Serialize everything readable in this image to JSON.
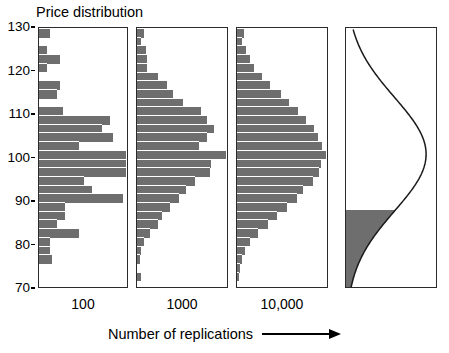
{
  "figure": {
    "title": "Price distribution",
    "x_axis_caption": "Number of replications",
    "var_label": "VAR"
  },
  "chart_data": {
    "type": "bar",
    "title": "Price distribution",
    "xlabel": "Number of replications",
    "ylabel": "Price distribution",
    "ylim": [
      70,
      130
    ],
    "yticks": [
      130,
      120,
      110,
      100,
      90,
      80,
      70
    ],
    "ytick_labels": [
      "130",
      "120",
      "110",
      "100",
      "90",
      "80",
      "70"
    ],
    "grid": false,
    "legend": null,
    "orientation": "horizontal",
    "panels": [
      {
        "name": "panel-100-replications",
        "xtick_label": "100",
        "replications": 100,
        "bin_low": 70,
        "bin_high": 130,
        "bin_width": 2,
        "categories": [
          128,
          126,
          124,
          122,
          120,
          118,
          116,
          114,
          112,
          110,
          108,
          106,
          104,
          102,
          100,
          98,
          96,
          94,
          92,
          90,
          88,
          86,
          84,
          82,
          80,
          78,
          76,
          74,
          72,
          70
        ],
        "values": [
          4,
          0,
          3,
          8,
          3,
          0,
          8,
          7,
          0,
          9,
          27,
          24,
          28,
          15,
          33,
          33,
          33,
          17,
          20,
          32,
          10,
          10,
          7,
          15,
          4,
          4,
          5,
          0,
          0,
          0
        ]
      },
      {
        "name": "panel-1000-replications",
        "xtick_label": "1000",
        "replications": 1000,
        "bin_low": 70,
        "bin_high": 130,
        "bin_width": 2,
        "categories": [
          128,
          126,
          124,
          122,
          120,
          118,
          116,
          114,
          112,
          110,
          108,
          106,
          104,
          102,
          100,
          98,
          96,
          94,
          92,
          90,
          88,
          86,
          84,
          82,
          80,
          78,
          76,
          74,
          72,
          70
        ],
        "values": [
          5,
          3,
          6,
          7,
          7,
          14,
          20,
          24,
          31,
          43,
          47,
          52,
          47,
          42,
          60,
          50,
          49,
          39,
          33,
          28,
          22,
          17,
          14,
          9,
          5,
          3,
          2,
          0,
          3,
          0
        ]
      },
      {
        "name": "panel-10000-replications",
        "xtick_label": "10,000",
        "replications": 10000,
        "bin_low": 70,
        "bin_high": 130,
        "bin_width": 2,
        "categories": [
          128,
          126,
          124,
          122,
          120,
          118,
          116,
          114,
          112,
          110,
          108,
          106,
          104,
          102,
          100,
          98,
          96,
          94,
          92,
          90,
          88,
          86,
          84,
          82,
          80,
          78,
          76,
          74,
          72,
          70
        ],
        "values": [
          5,
          4,
          7,
          10,
          13,
          19,
          25,
          33,
          39,
          46,
          52,
          58,
          61,
          64,
          67,
          63,
          62,
          57,
          50,
          45,
          38,
          30,
          23,
          16,
          10,
          6,
          4,
          2,
          1,
          0
        ]
      },
      {
        "name": "panel-limiting-distribution",
        "xtick_label": "",
        "curve": "normal-density",
        "mean": 101,
        "shaded_region": {
          "label": "VAR",
          "upper_bound": 88,
          "lower_bound": 70
        }
      }
    ],
    "xtick_labels": [
      "100",
      "1000",
      "10,000"
    ],
    "annotations": [
      "VAR"
    ]
  },
  "colors": {
    "bar_fill": "#6e6e6e",
    "panel_border": "#2b2b2b",
    "curve": "#1a1a1a",
    "shaded_fill": "#6e6e6e",
    "background": "#ffffff",
    "text": "#000000"
  }
}
